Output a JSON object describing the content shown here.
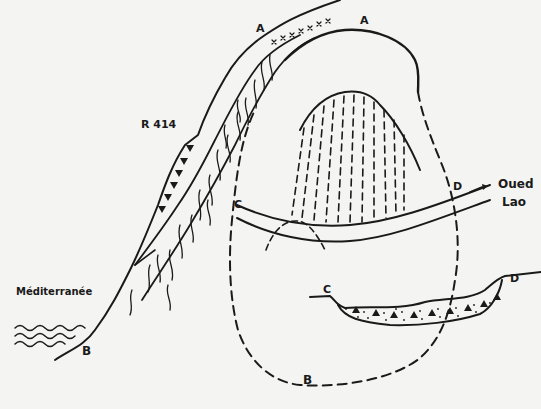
{
  "diagram": {
    "type": "hand-drawn geological cross-section / block sketch",
    "labels": {
      "a_left": "A",
      "a_right": "A",
      "road": "R 414",
      "c_left": "C",
      "d_right": "D",
      "river_line1": "Oued",
      "river_line2": "Lao",
      "sea": "Méditerranée",
      "b_left": "B",
      "b_bottom": "B",
      "c_profile": "C",
      "d_profile": "D"
    },
    "elements": [
      {
        "name": "coastal-slope",
        "description": "steep slope from sea (B) up to ridge (A) with road R 414"
      },
      {
        "name": "sea-waves",
        "description": "wavy lines marking the Mediterranean"
      },
      {
        "name": "outer-arc",
        "description": "solid arc A–A continuing as dashed closed loop down to B"
      },
      {
        "name": "inner-dome",
        "description": "dome outline filled with vertical dashed hatching"
      },
      {
        "name": "river-channel",
        "description": "double-line channel C–D of Oued Lao with flow arrow"
      },
      {
        "name": "valley-profile",
        "description": "profile C–D with lens of alluvium (dots and triangles)"
      }
    ],
    "colors": {
      "ink": "#1a1a1a",
      "paper": "#f4f4f2"
    }
  }
}
